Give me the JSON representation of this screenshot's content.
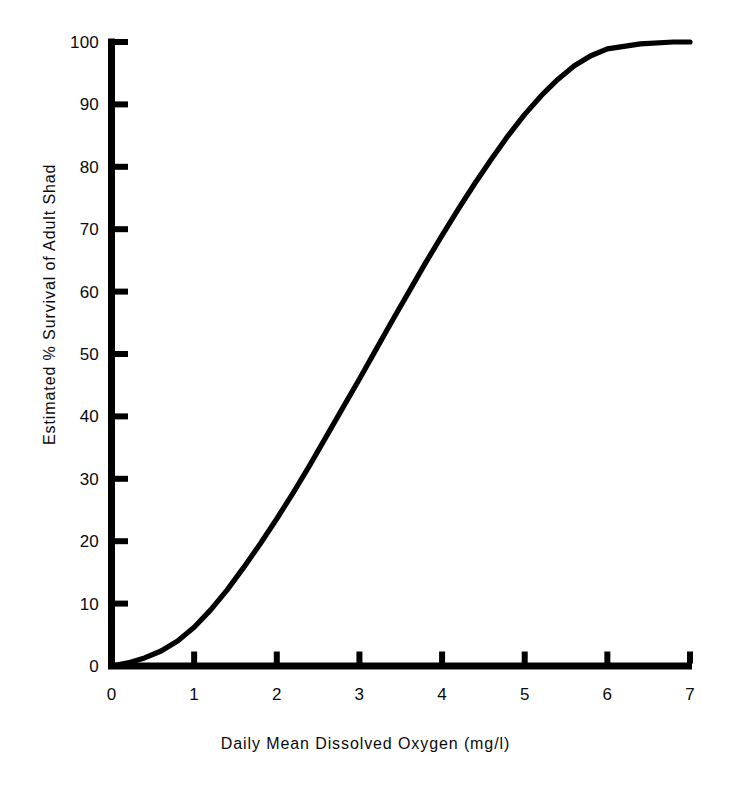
{
  "chart_data": {
    "type": "line",
    "title": "",
    "xlabel": "Daily Mean Dissolved Oxygen (mg/l)",
    "ylabel": "Estimated % Survival of Adult Shad",
    "xlim": [
      0,
      7
    ],
    "ylim": [
      0,
      100
    ],
    "grid": false,
    "legend": null,
    "xticks": [
      "0",
      "1",
      "2",
      "3",
      "4",
      "5",
      "6",
      "7"
    ],
    "xtick_values": [
      0,
      1,
      2,
      3,
      4,
      5,
      6,
      7
    ],
    "yticks": [
      "0",
      "10",
      "20",
      "30",
      "40",
      "50",
      "60",
      "70",
      "80",
      "90",
      "100"
    ],
    "ytick_values": [
      0,
      10,
      20,
      30,
      40,
      50,
      60,
      70,
      80,
      90,
      100
    ],
    "series": [
      {
        "name": "Estimated % survival of adult shad",
        "color": "#000000",
        "x": [
          0.0,
          0.2,
          0.4,
          0.6,
          0.8,
          1.0,
          1.2,
          1.4,
          1.6,
          1.8,
          2.0,
          2.2,
          2.4,
          2.6,
          2.8,
          3.0,
          3.2,
          3.4,
          3.6,
          3.8,
          4.0,
          4.2,
          4.4,
          4.6,
          4.8,
          5.0,
          5.2,
          5.4,
          5.6,
          5.8,
          6.0,
          6.4,
          6.8,
          7.0
        ],
        "y": [
          0.0,
          0.5,
          1.3,
          2.4,
          4.0,
          6.2,
          9.0,
          12.2,
          15.8,
          19.6,
          23.6,
          27.8,
          32.2,
          36.8,
          41.4,
          46.0,
          50.7,
          55.4,
          60.0,
          64.6,
          69.0,
          73.3,
          77.4,
          81.3,
          85.0,
          88.4,
          91.4,
          94.0,
          96.2,
          97.8,
          98.9,
          99.7,
          100.0,
          100.0
        ]
      }
    ]
  },
  "axes": {
    "x_axis_name": "x-axis",
    "y_axis_name": "y-axis",
    "tick_direction": "inward",
    "line_color": "#000000"
  }
}
